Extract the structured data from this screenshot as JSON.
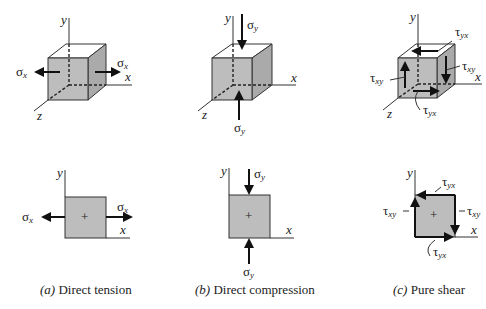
{
  "figure": {
    "panels": [
      {
        "id": "a",
        "caption_letter": "(a)",
        "caption_text": " Direct tension",
        "cube_labels": {
          "y": "y",
          "x": "x",
          "z": "z",
          "left_stress": "σ",
          "left_sub": "x",
          "right_stress": "σ",
          "right_sub": "x"
        },
        "square_labels": {
          "y": "y",
          "x": "x",
          "center": "+",
          "left_stress": "σ",
          "left_sub": "x",
          "right_stress": "σ",
          "right_sub": "x"
        }
      },
      {
        "id": "b",
        "caption_letter": "(b)",
        "caption_text": " Direct compression",
        "cube_labels": {
          "y": "y",
          "x": "x",
          "z": "z",
          "top_stress": "σ",
          "top_sub": "y",
          "bottom_stress": "σ",
          "bottom_sub": "y"
        },
        "square_labels": {
          "y": "y",
          "x": "x",
          "center": "+",
          "top_stress": "σ",
          "top_sub": "y",
          "bottom_stress": "σ",
          "bottom_sub": "y"
        }
      },
      {
        "id": "c",
        "caption_letter": "(c)",
        "caption_text": " Pure shear",
        "cube_labels": {
          "y": "y",
          "x": "x",
          "z": "z",
          "top_shear": "τ",
          "top_sub": "yx",
          "left_shear": "τ",
          "left_sub": "xy",
          "right_shear": "τ",
          "right_sub": "xy",
          "bottom_shear": "τ",
          "bottom_sub": "yx"
        },
        "square_labels": {
          "y": "y",
          "x": "x",
          "center": "+",
          "top_shear": "τ",
          "top_sub": "yx",
          "left_shear": "τ",
          "left_sub": "xy",
          "right_shear": "τ",
          "right_sub": "xy",
          "bottom_shear": "τ",
          "bottom_sub": "yx"
        }
      }
    ],
    "colors": {
      "face": "#bdbdbd",
      "side": "#aaaaaa",
      "stroke": "#333333",
      "background": "#ffffff"
    }
  }
}
